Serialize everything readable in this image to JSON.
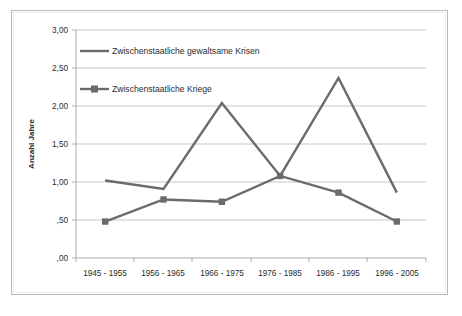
{
  "chart_data": {
    "type": "line",
    "title": "",
    "subtitle": "",
    "xlabel": "",
    "ylabel": "Anzahl Jahre",
    "categories": [
      "1945 - 1955",
      "1956 - 1965",
      "1966 - 1975",
      "1976 - 1985",
      "1986 - 1995",
      "1996 - 2005"
    ],
    "series": [
      {
        "name": "Zwischenstaatliche  gewaltsame Krisen",
        "values": [
          1.02,
          0.91,
          2.04,
          1.08,
          2.37,
          0.86
        ],
        "marker": "none",
        "color": "#6b6b6b"
      },
      {
        "name": "Zwischenstaatliche Kriege",
        "values": [
          0.48,
          0.77,
          0.74,
          1.08,
          0.86,
          0.48
        ],
        "marker": "square",
        "color": "#6b6b6b"
      }
    ],
    "ylim": [
      0,
      3.0
    ],
    "ytick_values": [
      0,
      0.5,
      1.0,
      1.5,
      2.0,
      2.5,
      3.0
    ],
    "ytick_labels": [
      ",00",
      ",50",
      "1,00",
      "1,50",
      "2,00",
      "2,50",
      "3,00"
    ],
    "grid": "horizontal",
    "legend_position": "inside-top-left",
    "decimal_separator": ","
  },
  "legend": {
    "entries": [
      {
        "label": "Zwischenstaatliche  gewaltsame Krisen",
        "marker": "none"
      },
      {
        "label": "Zwischenstaatliche Kriege",
        "marker": "square"
      }
    ]
  },
  "axes": {
    "y_title": "Anzahl Jahre",
    "y_labels": [
      ",00",
      ",50",
      "1,00",
      "1,50",
      "2,00",
      "2,50",
      "3,00"
    ],
    "x_labels": [
      "1945 - 1955",
      "1956 - 1965",
      "1966 - 1975",
      "1976 - 1985",
      "1986 - 1995",
      "1996 - 2005"
    ]
  },
  "caption": {
    "text": ""
  },
  "colors": {
    "line": "#6b6b6b",
    "grid": "#b0b0b0",
    "axis": "#9a9a9a",
    "frame": "#b9b9b9",
    "background": "#ffffff"
  }
}
